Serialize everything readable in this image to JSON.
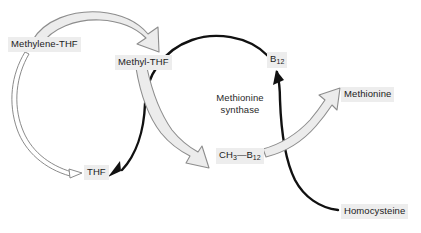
{
  "diagram": {
    "background_color": "#ffffff",
    "label_highlight_color": "#ededed",
    "text_color": "#1b1b1b",
    "gray_arrow_color": "#9a9a9a",
    "black_arrow_color": "#111111"
  },
  "nodes": {
    "methylene_thf": "Methylene-THF",
    "methyl_thf": "Methyl-THF",
    "thf": "THF",
    "b12_text": "B",
    "b12_sub": "12",
    "ch3_text": "CH",
    "ch3_sub": "3",
    "ch3_dash": "—",
    "ch3_b12_text": "B",
    "ch3_b12_sub": "12",
    "methionine": "Methionine",
    "homocysteine": "Homocysteine",
    "enzyme_line1": "Methionine",
    "enzyme_line2": "synthase"
  },
  "edges": [
    {
      "name": "methylene-thf-to-methyl-thf",
      "style": "gray-block-arrow",
      "from": "Methylene-THF",
      "to": "Methyl-THF"
    },
    {
      "name": "methylene-thf-to-thf",
      "style": "thin-outline-arrow",
      "from": "Methylene-THF",
      "to": "THF"
    },
    {
      "name": "methyl-thf-to-ch3-b12",
      "style": "gray-block-arrow",
      "from": "Methyl-THF",
      "to": "CH3-B12"
    },
    {
      "name": "b12-cycle-to-thf",
      "style": "black-line-arrow",
      "from": "B12",
      "to": "THF"
    },
    {
      "name": "homocysteine-to-b12",
      "style": "black-line-arrow",
      "from": "Homocysteine",
      "to": "B12"
    },
    {
      "name": "ch3-b12-to-methionine",
      "style": "gray-block-arrow",
      "from": "CH3-B12",
      "to": "Methionine"
    }
  ]
}
